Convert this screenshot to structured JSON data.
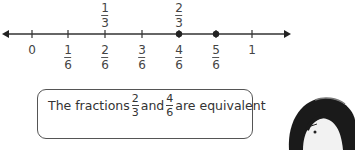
{
  "number_line": {
    "ticks": [
      {
        "pos": 0,
        "label": "0",
        "x": 32
      },
      {
        "pos": 1,
        "num": "1",
        "den": "6",
        "x": 68
      },
      {
        "pos": 2,
        "num": "2",
        "den": "6",
        "x": 105,
        "above_num": "1",
        "above_den": "3"
      },
      {
        "pos": 3,
        "num": "3",
        "den": "6",
        "x": 142
      },
      {
        "pos": 4,
        "num": "4",
        "den": "6",
        "x": 179,
        "above_num": "2",
        "above_den": "3",
        "dot": true
      },
      {
        "pos": 5,
        "num": "5",
        "den": "6",
        "x": 216,
        "dot": true
      },
      {
        "pos": 6,
        "label": "1",
        "x": 252
      }
    ]
  },
  "callout": {
    "text_prefix": "The fractions",
    "frac1_num": "2",
    "frac1_den": "3",
    "middle": "and",
    "frac2_num": "4",
    "frac2_den": "6",
    "suffix": "are equivalent"
  }
}
